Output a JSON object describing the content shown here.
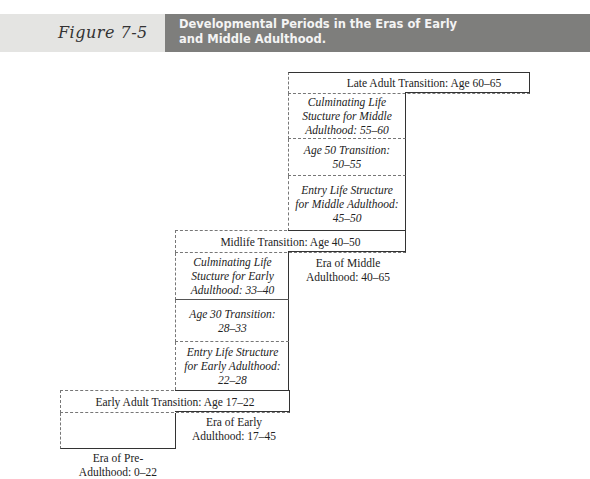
{
  "header": {
    "figure_label": "Figure 7-5",
    "title_line1": "Developmental Periods in the Eras of Early",
    "title_line2": "and Middle Adulthood."
  },
  "diagram": {
    "late_transition": "Late Adult Transition: Age 60–65",
    "middle_column": [
      {
        "line1": "Culminating Life",
        "line2": "Stucture for Middle",
        "line3": "Adulthood: 55–60"
      },
      {
        "line1": "Age 50 Transition:",
        "line2": "50–55"
      },
      {
        "line1": "Entry Life Structure",
        "line2": "for Middle Adulthood:",
        "line3": "45–50"
      }
    ],
    "midlife_transition": "Midlife Transition: Age 40–50",
    "era_middle": {
      "line1": "Era of Middle",
      "line2": "Adulthood: 40–65"
    },
    "early_column": [
      {
        "line1": "Culminating Life",
        "line2": "Stucture for Early",
        "line3": "Adulthood: 33–40"
      },
      {
        "line1": "Age 30 Transition:",
        "line2": "28–33"
      },
      {
        "line1": "Entry Life Structure",
        "line2": "for Early Adulthood:",
        "line3": "22–28"
      }
    ],
    "early_transition": "Early Adult Transition: Age 17–22",
    "era_early": {
      "line1": "Era of Early",
      "line2": "Adulthood: 17–45"
    },
    "era_pre": {
      "line1": "Era of Pre-",
      "line2": "Adulthood: 0–22"
    }
  },
  "colors": {
    "header_light": "#e4e4e2",
    "header_dark": "#7e7e7c",
    "line": "#333333",
    "dash": "#777777"
  }
}
